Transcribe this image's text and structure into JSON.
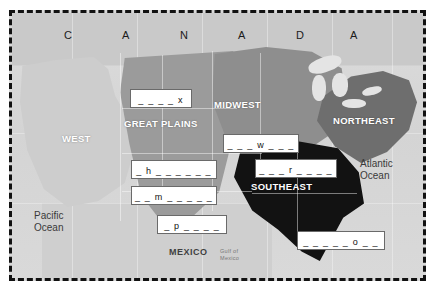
{
  "worksheet": {
    "title_row": {
      "country_label": "CANADA",
      "letters": [
        "C",
        "A",
        "N",
        "A",
        "D",
        "A"
      ]
    },
    "regions": [
      {
        "id": "west",
        "label": "WEST",
        "shade": "#cdcdcd"
      },
      {
        "id": "great-plains",
        "label": "GREAT PLAINS",
        "shade": "#9b9b9b"
      },
      {
        "id": "midwest",
        "label": "MIDWEST",
        "shade": "#8e8e8e"
      },
      {
        "id": "northeast",
        "label": "NORTHEAST",
        "shade": "#6e6e6e"
      },
      {
        "id": "southeast",
        "label": "SOUTHEAST",
        "shade": "#121212"
      }
    ],
    "water_labels": [
      {
        "id": "pacific",
        "line1": "Pacific",
        "line2": "Ocean"
      },
      {
        "id": "atlantic",
        "line1": "Atlantic",
        "line2": "Ocean"
      },
      {
        "id": "gulf",
        "line1": "Gulf of",
        "line2": "Mexico"
      }
    ],
    "neighbors": [
      {
        "id": "mexico",
        "label": "MEXICO"
      }
    ],
    "answer_blanks": [
      {
        "id": "blank-x",
        "text": "_ _ _ _ x",
        "hint_letter": "x"
      },
      {
        "id": "blank-w",
        "text": "_ _ _ w _ _ _",
        "hint_letter": "w"
      },
      {
        "id": "blank-r",
        "text": "_ _ _ r _ _ _ _",
        "hint_letter": "r"
      },
      {
        "id": "blank-h",
        "text": "_ h _ _ _ _ _ _",
        "hint_letter": "h"
      },
      {
        "id": "blank-m",
        "text": "_ _ m _ _ _ _ _",
        "hint_letter": "m"
      },
      {
        "id": "blank-p",
        "text": "_ p _ _ _ _",
        "hint_letter": "p"
      },
      {
        "id": "blank-o",
        "text": "_ _ _ _ _ o _ _",
        "hint_letter": "o"
      }
    ],
    "colors": {
      "border": "#111111",
      "paper": "#ffffff",
      "blank_fill": "#ffffff",
      "blank_stroke": "#6a6a6a"
    }
  }
}
